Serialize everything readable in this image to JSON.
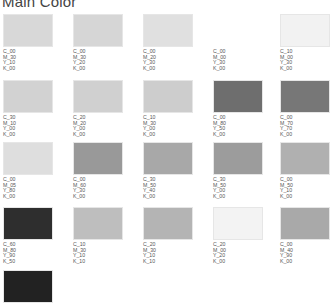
{
  "title": "Main Color",
  "swatches": [
    {
      "c": "C_00",
      "m": "M_30",
      "y": "Y_10",
      "k": "K_00",
      "color": "#d8d8d8"
    },
    {
      "c": "C_00",
      "m": "M_30",
      "y": "Y_20",
      "k": "K_00",
      "color": "#d6d6d6"
    },
    {
      "c": "C_00",
      "m": "M_20",
      "y": "Y_30",
      "k": "K_00",
      "color": "#e0e0e0"
    },
    {
      "c": "C_00",
      "m": "M_00",
      "y": "Y_30",
      "k": "K_00",
      "color": "#ffffff"
    },
    {
      "c": "C_10",
      "m": "M_00",
      "y": "Y_30",
      "k": "K_00",
      "color": "#f2f2f2"
    },
    {
      "c": "C_30",
      "m": "M_10",
      "y": "Y_00",
      "k": "K_00",
      "color": "#d2d2d2"
    },
    {
      "c": "C_20",
      "m": "M_20",
      "y": "Y_00",
      "k": "K_00",
      "color": "#d0d0d0"
    },
    {
      "c": "C_10",
      "m": "M_30",
      "y": "Y_00",
      "k": "K_00",
      "color": "#cdcdcd"
    },
    {
      "c": "C_00",
      "m": "M_80",
      "y": "Y_50",
      "k": "K_00",
      "color": "#6e6e6e"
    },
    {
      "c": "C_00",
      "m": "M_70",
      "y": "Y_70",
      "k": "K_00",
      "color": "#777777"
    },
    {
      "c": "C_00",
      "m": "M_05",
      "y": "Y_80",
      "k": "K_00",
      "color": "#dedede"
    },
    {
      "c": "C_00",
      "m": "M_60",
      "y": "Y_30",
      "k": "K_00",
      "color": "#999999"
    },
    {
      "c": "C_30",
      "m": "M_50",
      "y": "Y_40",
      "k": "K_00",
      "color": "#a8a8a8"
    },
    {
      "c": "C_30",
      "m": "M_50",
      "y": "Y_00",
      "k": "K_00",
      "color": "#9c9c9c"
    },
    {
      "c": "C_00",
      "m": "M_50",
      "y": "Y_10",
      "k": "K_00",
      "color": "#b0b0b0"
    },
    {
      "c": "C_60",
      "m": "M_80",
      "y": "Y_90",
      "k": "K_50",
      "color": "#2e2e2e"
    },
    {
      "c": "C_10",
      "m": "M_30",
      "y": "Y_10",
      "k": "K_10",
      "color": "#bebebe"
    },
    {
      "c": "C_20",
      "m": "M_30",
      "y": "Y_10",
      "k": "K_10",
      "color": "#b4b4b4"
    },
    {
      "c": "C_20",
      "m": "M_00",
      "y": "Y_20",
      "k": "K_00",
      "color": "#f3f3f3"
    },
    {
      "c": "C_00",
      "m": "M_40",
      "y": "Y_90",
      "k": "K_00",
      "color": "#a9a9a9"
    },
    {
      "c": "",
      "m": "",
      "y": "",
      "k": "",
      "color": "#222222"
    }
  ]
}
